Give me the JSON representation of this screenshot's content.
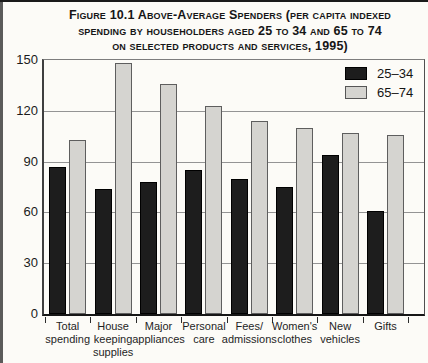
{
  "title": {
    "line1": "Figure 10.1 Above-Average Spenders (per capita indexed",
    "line2": "spending by householders aged 25 to 34 and 65 to 74",
    "line3": "on selected products and services, 1995)"
  },
  "legend": {
    "items": [
      {
        "label": "25–34",
        "color": "#1d1d1d"
      },
      {
        "label": "65–74",
        "color": "#d5d4d0"
      }
    ]
  },
  "chart_data": {
    "type": "bar",
    "title": "Figure 10.1 Above-Average Spenders (per capita indexed spending by householders aged 25 to 34 and 65 to 74 on selected products and services, 1995)",
    "categories": [
      "Total spending",
      "House keeping supplies",
      "Major appliances",
      "Personal care",
      "Fees/admissions",
      "Women's clothes",
      "New vehicles",
      "Gifts"
    ],
    "category_label_lines": [
      [
        "Total",
        "spending"
      ],
      [
        "House",
        "keeping",
        "supplies"
      ],
      [
        "Major",
        "appliances"
      ],
      [
        "Personal",
        "care"
      ],
      [
        "Fees/",
        "admissions"
      ],
      [
        "Women's",
        "clothes"
      ],
      [
        "New",
        "vehicles"
      ],
      [
        "Gifts"
      ]
    ],
    "series": [
      {
        "name": "25–34",
        "color": "#1d1d1d",
        "values": [
          87,
          74,
          78,
          85,
          80,
          75,
          94,
          61
        ]
      },
      {
        "name": "65–74",
        "color": "#d5d4d0",
        "values": [
          103,
          148,
          136,
          123,
          114,
          110,
          107,
          106
        ]
      }
    ],
    "xlabel": "",
    "ylabel": "",
    "ylim": [
      0,
      150
    ],
    "yticks": [
      0,
      30,
      60,
      90,
      120,
      150
    ],
    "grid": true,
    "legend_position": "top-right"
  }
}
